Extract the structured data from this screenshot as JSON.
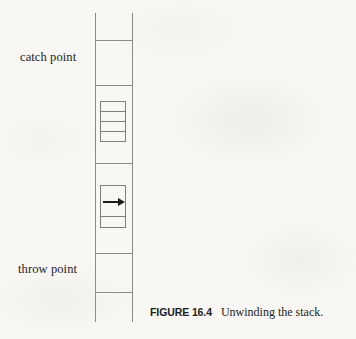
{
  "figure": {
    "caption_tag": "FIGURE 16.4",
    "caption_text": "Unwinding the stack.",
    "labels": {
      "catch": "catch point",
      "throw": "throw point"
    },
    "arrow_icon": "arrow-right-icon",
    "colors": {
      "paper": "#f8f7f4",
      "line": "#8a8a88",
      "inner_line": "#7e7e7c",
      "arrow": "#1c1c1c",
      "text": "#24211f"
    },
    "stack": {
      "column": {
        "x": 95,
        "y": 13,
        "width": 38,
        "height": 309
      },
      "dividers_y": [
        40,
        85,
        163,
        253,
        292
      ],
      "frames": [
        {
          "name": "four-row-frame",
          "x": 100,
          "y": 101,
          "width": 26,
          "height": 41,
          "rows": 4
        },
        {
          "name": "arrow-frame",
          "x": 100,
          "y": 185,
          "width": 26,
          "height": 43,
          "rows": 2,
          "arrow": true
        }
      ]
    }
  }
}
